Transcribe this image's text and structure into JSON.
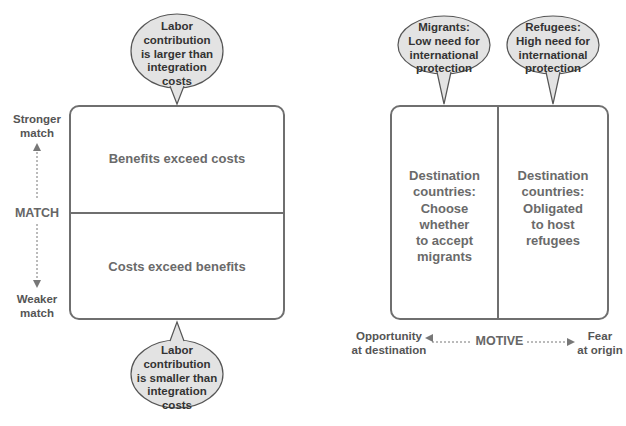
{
  "left_diagram": {
    "top_bubble": "Labor contribution is larger than integration costs",
    "top_bubble_lines": [
      "Labor",
      "contribution",
      "is larger than",
      "integration",
      "costs"
    ],
    "bottom_bubble_lines": [
      "Labor",
      "contribution",
      "is smaller than",
      "integration",
      "costs"
    ],
    "upper_cell": "Benefits exceed costs",
    "lower_cell": "Costs exceed benefits",
    "axis_label": "MATCH",
    "axis_top": "Stronger match",
    "axis_top_lines": [
      "Stronger",
      "match"
    ],
    "axis_bottom_lines": [
      "Weaker",
      "match"
    ]
  },
  "right_diagram": {
    "left_bubble_lines": [
      "Migrants:",
      "Low need for",
      "international",
      "protection"
    ],
    "right_bubble_lines": [
      "Refugees:",
      "High need for",
      "international",
      "protection"
    ],
    "left_cell_lines": [
      "Destination",
      "countries:",
      "Choose",
      "whether",
      "to accept",
      "migrants"
    ],
    "right_cell_lines": [
      "Destination",
      "countries:",
      "Obligated",
      "to host",
      "refugees"
    ],
    "axis_label": "MOTIVE",
    "axis_left_lines": [
      "Opportunity",
      "at destination"
    ],
    "axis_right_lines": [
      "Fear",
      "at origin"
    ]
  },
  "colors": {
    "line": "#6f6f6f",
    "bubble_fill": "#e3e3e3",
    "bubble_stroke": "#555555"
  }
}
